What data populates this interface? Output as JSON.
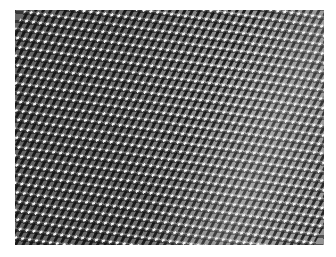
{
  "image": {
    "subject": "perforated metal mesh surface",
    "tone": "grayscale",
    "colors": {
      "background": "#ffffff",
      "mid_gray": "#6e6e6e",
      "dark": "#141414",
      "highlight": "#ffffff"
    }
  }
}
